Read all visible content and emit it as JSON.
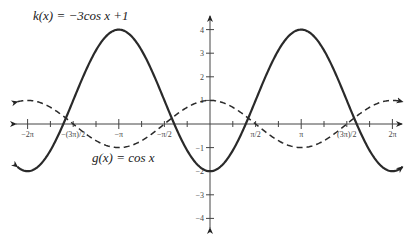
{
  "chart_data": {
    "type": "line",
    "title": "",
    "xlabel": "",
    "ylabel": "",
    "xlim": [
      -6.2832,
      6.2832
    ],
    "ylim": [
      -4,
      4
    ],
    "grid": false,
    "x_ticks": [
      {
        "value": -6.2832,
        "label": "−2π"
      },
      {
        "value": -4.7124,
        "label": "(3π)/2",
        "prefix": "−"
      },
      {
        "value": -3.1416,
        "label": "−π"
      },
      {
        "value": -1.5708,
        "label": "−π/2"
      },
      {
        "value": 1.5708,
        "label": "π/2"
      },
      {
        "value": 3.1416,
        "label": "π"
      },
      {
        "value": 4.7124,
        "label": "(3π)/2"
      },
      {
        "value": 6.2832,
        "label": "2π"
      }
    ],
    "y_ticks": [
      {
        "value": 4,
        "label": "4"
      },
      {
        "value": 3,
        "label": "3"
      },
      {
        "value": 2,
        "label": "2"
      },
      {
        "value": 1,
        "label": "1"
      },
      {
        "value": -1,
        "label": "−1"
      },
      {
        "value": -2,
        "label": "−2"
      },
      {
        "value": -3,
        "label": "−3"
      },
      {
        "value": -4,
        "label": "−4"
      }
    ],
    "series": [
      {
        "name": "k(x) = −3cos x + 1",
        "style": "solid",
        "color": "#222222",
        "formula": "-3*cos(x)+1",
        "x": [
          -6.2832,
          -4.7124,
          -3.1416,
          -1.5708,
          0,
          1.5708,
          3.1416,
          4.7124,
          6.2832
        ],
        "values": [
          -2,
          1,
          4,
          1,
          -2,
          1,
          4,
          1,
          -2
        ]
      },
      {
        "name": "g(x) = cos x",
        "style": "dashed",
        "color": "#222222",
        "formula": "cos(x)",
        "x": [
          -6.2832,
          -4.7124,
          -3.1416,
          -1.5708,
          0,
          1.5708,
          3.1416,
          4.7124,
          6.2832
        ],
        "values": [
          1,
          0,
          -1,
          0,
          1,
          0,
          -1,
          0,
          1
        ]
      }
    ],
    "annotations": [
      {
        "text_name": "k",
        "text_arg": "x",
        "text_rhs": "= −3cos x + 1"
      },
      {
        "text_name": "g",
        "text_arg": "x",
        "text_rhs": "= cos x"
      }
    ]
  },
  "labels": {
    "k_eq": "k(x) = −3cos x +1",
    "g_eq": "g(x) = cos x"
  }
}
